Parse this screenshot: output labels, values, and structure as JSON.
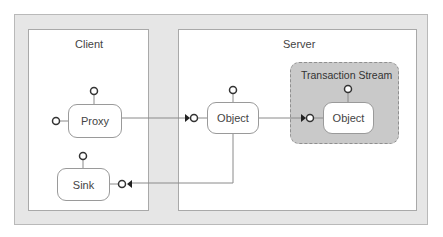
{
  "diagram": {
    "colors": {
      "frame_background": "#e6e6e6",
      "panel_background": "#ffffff",
      "stream_background": "#c9c9c9",
      "line": "#8a8a8a",
      "port": "#333333"
    },
    "panels": {
      "client": {
        "label": "Client"
      },
      "server": {
        "label": "Server"
      }
    },
    "transaction_stream": {
      "label": "Transaction Stream"
    },
    "nodes": {
      "proxy": {
        "label": "Proxy"
      },
      "sink": {
        "label": "Sink"
      },
      "server_object": {
        "label": "Object"
      },
      "stream_object": {
        "label": "Object"
      }
    },
    "connections": [
      {
        "from": "Proxy",
        "to": "Object (Server)"
      },
      {
        "from": "Object (Server)",
        "to": "Object (Transaction Stream)"
      },
      {
        "from": "Object (Server)",
        "to": "Sink"
      }
    ]
  }
}
